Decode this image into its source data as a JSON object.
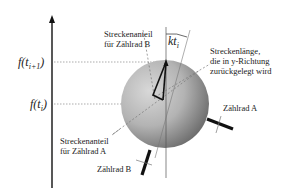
{
  "diagram": {
    "axis": {
      "ticks": [
        {
          "id": "f_ti1",
          "label": "f(t",
          "sub": "i+1",
          "close": ")"
        },
        {
          "id": "f_ti",
          "label": "f(t",
          "sub": "i",
          "close": ")"
        }
      ]
    },
    "angle_label": {
      "text": "kt",
      "sub": "i"
    },
    "labels": {
      "streckenanteil_b": [
        "Streckenanteil",
        "für Zählrad B"
      ],
      "streckenlaenge": [
        "Streckenlänge,",
        "die in y-Richtung",
        "zurückgelegt wird"
      ],
      "streckenanteil_a": [
        "Streckenanteil",
        "für Zählrad A"
      ],
      "zaehlrad_a": "Zählrad A",
      "zaehlrad_b": "Zählrad B"
    },
    "colors": {
      "line": "#111111",
      "dashed": "#777777",
      "circle_light": "#d4d4d4",
      "circle_dark": "#6a6a6a"
    }
  }
}
